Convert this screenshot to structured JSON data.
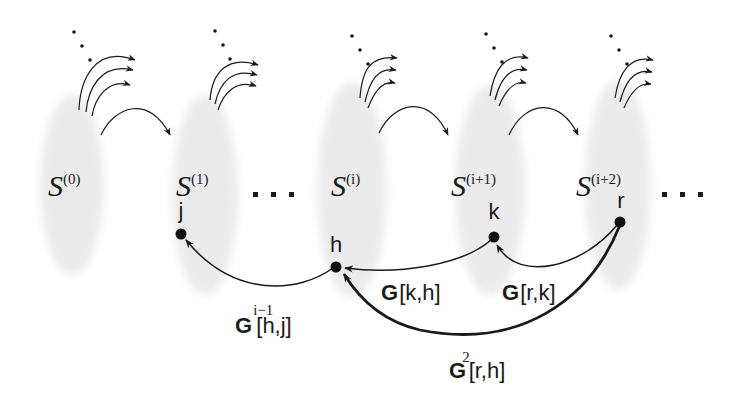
{
  "diagram": {
    "type": "state-sequence-graph",
    "colors": {
      "background": "#ffffff",
      "ellipse_fill": "#ebebeb",
      "stroke": "#1a1a1a",
      "node": "#111111"
    },
    "sets": [
      {
        "id": "s0",
        "base": "S",
        "sup": "(0)",
        "cx": 72
      },
      {
        "id": "s1",
        "base": "S",
        "sup": "(1)",
        "cx": 205
      },
      {
        "id": "si",
        "base": "S",
        "sup": "(i)",
        "cx": 352
      },
      {
        "id": "si1",
        "base": "S",
        "sup": "(i+1)",
        "cx": 490
      },
      {
        "id": "si2",
        "base": "S",
        "sup": "(i+2)",
        "cx": 618
      }
    ],
    "ellipsis_between": "...",
    "ellipsis_after": "...",
    "nodes": [
      {
        "id": "j",
        "label": "j",
        "x": 181,
        "y": 234
      },
      {
        "id": "h",
        "label": "h",
        "x": 336,
        "y": 267
      },
      {
        "id": "k",
        "label": "k",
        "x": 494,
        "y": 237
      },
      {
        "id": "r",
        "label": "r",
        "x": 620,
        "y": 222
      }
    ],
    "edges": [
      {
        "from": "h",
        "to": "j",
        "label_base": "G",
        "label_sup": "i−1",
        "label_args": "[h,j]"
      },
      {
        "from": "k",
        "to": "h",
        "label_base": "G",
        "label_sup": "",
        "label_args": "[k,h]"
      },
      {
        "from": "r",
        "to": "k",
        "label_base": "G",
        "label_sup": "",
        "label_args": "[r,k]"
      },
      {
        "from": "r",
        "to": "h",
        "label_base": "G",
        "label_sup": "2",
        "label_args": "[r,h]",
        "bold": true
      }
    ]
  }
}
